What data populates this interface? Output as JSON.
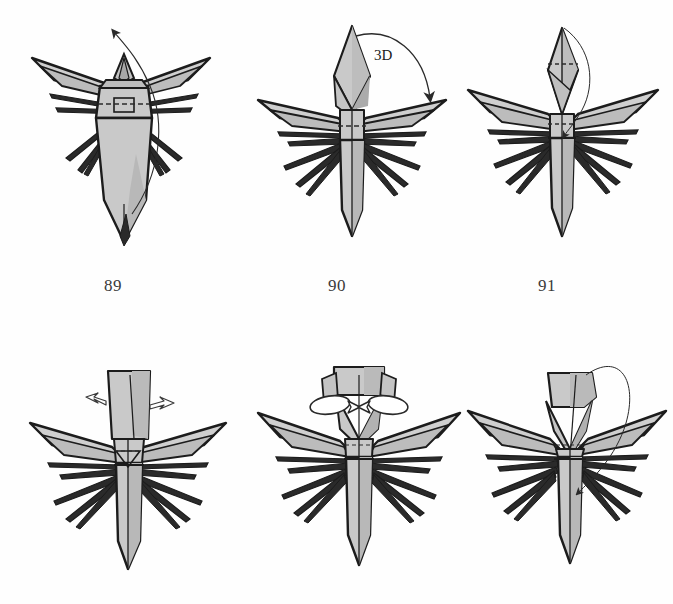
{
  "page": {
    "kind": "origami-instruction-diagram",
    "background_color": "#fefefe",
    "width": 673,
    "height": 604
  },
  "palette": {
    "paper_front": "#c9c9c9",
    "paper_front_light": "#d6d6d6",
    "paper_shadow": "#b0b0b0",
    "paper_dark": "#9a9a9a",
    "outline": "#1c1c1c",
    "crease_dashed": "#2b2b2b",
    "arrow_thin": "#2a2a2a",
    "arrow_hollow_fill": "#ffffff",
    "label_color": "#3a3a3a"
  },
  "steps": [
    {
      "id": "step-89",
      "number": "89",
      "row": "top",
      "column": "left",
      "model": "winged-insect-front-view",
      "annotations": [
        {
          "type": "thin-curved-arrow",
          "name": "unfold-arrow",
          "direction": "up-left",
          "note": "thin looping arrow rising from body to upper-left"
        },
        {
          "type": "dashed-crease",
          "name": "horizontal-valley-fold",
          "orientation": "horizontal"
        },
        {
          "type": "small-square-detail",
          "name": "head-square-detail"
        }
      ]
    },
    {
      "id": "step-90",
      "number": "90",
      "row": "top",
      "column": "center",
      "model": "winged-insect-diamond-head",
      "annotations": [
        {
          "type": "curved-arrow-with-label",
          "name": "three-d-arrow",
          "label": "3D",
          "direction": "clockwise-down-right"
        },
        {
          "type": "dashed-crease",
          "name": "horizontal-valley-fold",
          "orientation": "horizontal"
        }
      ]
    },
    {
      "id": "step-91",
      "number": "91",
      "row": "top",
      "column": "right",
      "model": "winged-insect-pointed-head",
      "annotations": [
        {
          "type": "thin-curved-arrow",
          "name": "tuck-arrow",
          "direction": "down-into-body"
        },
        {
          "type": "dashed-crease",
          "name": "head-horizontal-crease",
          "orientation": "horizontal"
        },
        {
          "type": "dashed-crease",
          "name": "thorax-horizontal-crease",
          "orientation": "horizontal"
        }
      ]
    },
    {
      "id": "step-92",
      "number": "",
      "row": "bottom",
      "column": "left",
      "model": "winged-insect-flat-head",
      "annotations": [
        {
          "type": "hollow-arrow",
          "name": "spread-arrow-left",
          "direction": "left"
        },
        {
          "type": "hollow-arrow",
          "name": "spread-arrow-right",
          "direction": "right"
        },
        {
          "type": "dashed-crease",
          "name": "thorax-horizontal-crease",
          "orientation": "horizontal"
        }
      ]
    },
    {
      "id": "step-93",
      "number": "",
      "row": "bottom",
      "column": "center",
      "model": "winged-insect-open-head",
      "annotations": [
        {
          "type": "hollow-loop-arrow",
          "name": "roll-arrow-left",
          "direction": "counter-clockwise"
        },
        {
          "type": "hollow-loop-arrow",
          "name": "roll-arrow-right",
          "direction": "clockwise"
        },
        {
          "type": "dashed-crease",
          "name": "thorax-horizontal-crease",
          "orientation": "horizontal"
        }
      ]
    },
    {
      "id": "step-94",
      "number": "",
      "row": "bottom",
      "column": "right",
      "model": "winged-insect-folded-head",
      "annotations": [
        {
          "type": "thin-loop-arrow",
          "name": "fold-over-arrow",
          "direction": "over-the-top-down"
        },
        {
          "type": "dashed-crease",
          "name": "thorax-horizontal-crease",
          "orientation": "horizontal"
        }
      ]
    }
  ],
  "labels": {
    "three_d": "3D",
    "step_89": "89",
    "step_90": "90",
    "step_91": "91"
  }
}
